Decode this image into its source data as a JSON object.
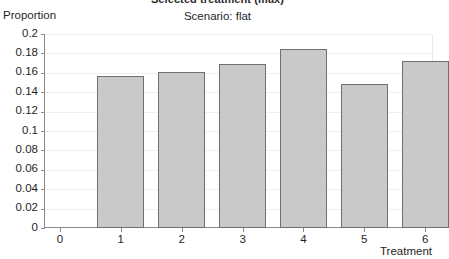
{
  "chart_data": {
    "type": "bar",
    "title": "Selected treatment (max)",
    "subtitle": "Scenario: flat",
    "xlabel": "Treatment",
    "ylabel": "Proportion",
    "categories": [
      "1",
      "2",
      "3",
      "4",
      "5",
      "6"
    ],
    "values": [
      0.157,
      0.161,
      0.169,
      0.185,
      0.148,
      0.172
    ],
    "xtick_labels": [
      "0",
      "1",
      "2",
      "3",
      "4",
      "5",
      "6"
    ],
    "ytick_labels": [
      "0",
      "0.02",
      "0.04",
      "0.06",
      "0.08",
      "0.1",
      "0.12",
      "0.14",
      "0.16",
      "0.18",
      "0.2"
    ],
    "ytick_values": [
      0,
      0.02,
      0.04,
      0.06,
      0.08,
      0.1,
      0.12,
      0.14,
      0.16,
      0.18,
      0.2
    ],
    "ylim": [
      0,
      0.2
    ],
    "xlim": [
      0,
      6.5
    ],
    "grid": true,
    "legend": null,
    "bar_fill_color": "#c9c9c9",
    "bar_border_color": "#6f6f6f",
    "axis_color": "#8a8a8a"
  }
}
